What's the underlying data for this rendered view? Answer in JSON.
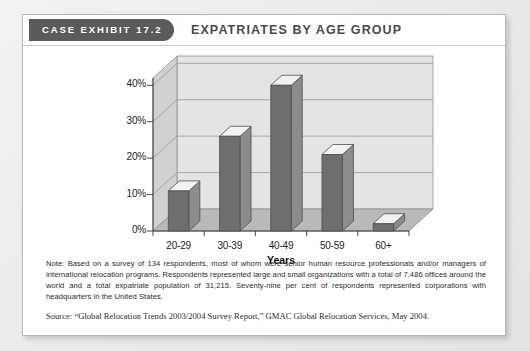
{
  "card": {
    "badge_label": "CASE EXHIBIT",
    "badge_number": "17.2",
    "title": "EXPATRIATES BY AGE GROUP"
  },
  "chart_data": {
    "type": "bar",
    "title": "EXPATRIATES BY AGE GROUP",
    "categories": [
      "20-29",
      "30-39",
      "40-49",
      "50-59",
      "60+"
    ],
    "values": [
      11,
      26,
      40,
      21,
      2
    ],
    "xlabel": "Years",
    "ylabel": "",
    "ylim": [
      0,
      42
    ],
    "yticks": [
      "0%",
      "10%",
      "20%",
      "30%",
      "40%"
    ],
    "ytick_values": [
      0,
      10,
      20,
      30,
      40
    ],
    "grid": true,
    "legend": "none",
    "style": "3d-column",
    "colors": {
      "bar_front": "#6e6e6e",
      "bar_side": "#8c8c8c",
      "bar_top": "#f2f2f2",
      "plot_back": "#e4e4e4",
      "plot_floor": "#b9b9b9",
      "plot_left_wall": "#d0d0d0",
      "gridline": "#9a9a9a"
    }
  },
  "notes": {
    "note": "Note: Based on a survey of 134 respondents, most of whom were senior human resource professionals and/or managers of international relocation programs. Respondents represented large and small organizations with a total of 7,486 offices around the world and a total expatriate population of 31,215. Seventy-nine per cent of respondents represented corporations with headquarters in the United States.",
    "source": "Source: “Global Relocation Trends 2003/2004 Survey Report,” GMAC Global Relocation Services, May 2004."
  }
}
